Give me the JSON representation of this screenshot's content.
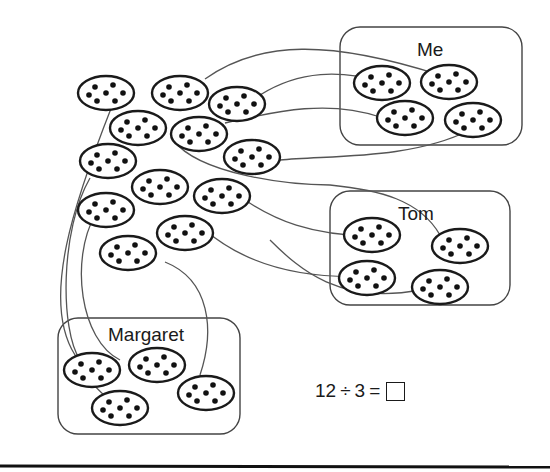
{
  "groups": [
    {
      "label": "Me",
      "cookie_count": 4
    },
    {
      "label": "Tom",
      "cookie_count": 4
    },
    {
      "label": "Margaret",
      "cookie_count": 4
    }
  ],
  "equation": {
    "dividend": "12",
    "operator": "÷",
    "divisor": "3",
    "equals": "=",
    "answer": ""
  },
  "unassigned_cookie_count": 12,
  "colors": {
    "outline": "#1a1a1a",
    "connector": "#555555",
    "background": "#ffffff"
  }
}
